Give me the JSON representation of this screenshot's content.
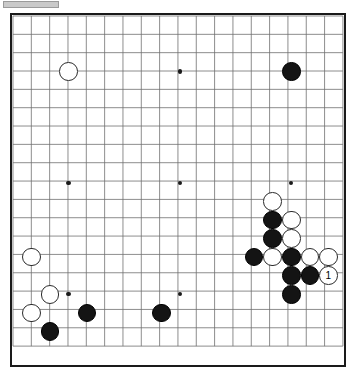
{
  "app": {
    "title": "Go Board Diagram",
    "topbar_label": ""
  },
  "board": {
    "size": 19,
    "label": "Go board 19x19",
    "colors": {
      "grid_line": "#6e6e6e",
      "border": "#1a1a1a",
      "background": "#ffffff",
      "black_stone": "#141414",
      "white_stone": "#ffffff",
      "star_point": "#1a1a1a",
      "topbar": "#c9c9c9"
    },
    "geometry": {
      "left": 11,
      "top": 14,
      "spacing": 18.55,
      "stone_diameter": 18.5,
      "star_diameter": 4.4
    },
    "star_points": [
      {
        "col": 3,
        "row": 3
      },
      {
        "col": 9,
        "row": 3
      },
      {
        "col": 15,
        "row": 3
      },
      {
        "col": 3,
        "row": 9
      },
      {
        "col": 9,
        "row": 9
      },
      {
        "col": 15,
        "row": 9
      },
      {
        "col": 3,
        "row": 15
      },
      {
        "col": 9,
        "row": 15
      },
      {
        "col": 15,
        "row": 15
      }
    ],
    "stones": [
      {
        "col": 3,
        "row": 3,
        "color": "white",
        "label": ""
      },
      {
        "col": 15,
        "row": 3,
        "color": "black",
        "label": ""
      },
      {
        "col": 14,
        "row": 10,
        "color": "white",
        "label": ""
      },
      {
        "col": 14,
        "row": 11,
        "color": "black",
        "label": ""
      },
      {
        "col": 15,
        "row": 11,
        "color": "white",
        "label": ""
      },
      {
        "col": 14,
        "row": 12,
        "color": "black",
        "label": ""
      },
      {
        "col": 15,
        "row": 12,
        "color": "white",
        "label": ""
      },
      {
        "col": 13,
        "row": 13,
        "color": "black",
        "label": ""
      },
      {
        "col": 14,
        "row": 13,
        "color": "white",
        "label": ""
      },
      {
        "col": 15,
        "row": 13,
        "color": "black",
        "label": ""
      },
      {
        "col": 16,
        "row": 13,
        "color": "white",
        "label": ""
      },
      {
        "col": 17,
        "row": 13,
        "color": "white",
        "label": ""
      },
      {
        "col": 15,
        "row": 14,
        "color": "black",
        "label": ""
      },
      {
        "col": 16,
        "row": 14,
        "color": "black",
        "label": ""
      },
      {
        "col": 17,
        "row": 14,
        "color": "white",
        "label": "1"
      },
      {
        "col": 15,
        "row": 15,
        "color": "black",
        "label": ""
      },
      {
        "col": 1,
        "row": 13,
        "color": "white",
        "label": ""
      },
      {
        "col": 2,
        "row": 15,
        "color": "white",
        "label": ""
      },
      {
        "col": 1,
        "row": 16,
        "color": "white",
        "label": ""
      },
      {
        "col": 2,
        "row": 17,
        "color": "black",
        "label": ""
      },
      {
        "col": 4,
        "row": 16,
        "color": "black",
        "label": ""
      },
      {
        "col": 8,
        "row": 16,
        "color": "black",
        "label": ""
      }
    ]
  }
}
